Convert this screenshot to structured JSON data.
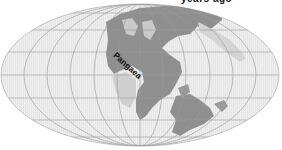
{
  "map": {
    "projection": "mollweide",
    "region_label": "Pangaea",
    "top_caption_partial": "years ago",
    "colors": {
      "background": "#ffffff",
      "ocean": "#e8e8e8",
      "land": "#8f8f8f",
      "land_light": "#c9c9c9",
      "graticule": "#9a9a9a",
      "label": "#111111"
    }
  }
}
